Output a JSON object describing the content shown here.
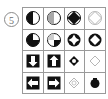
{
  "figure": {
    "kind": "matrix-reasoning-puzzle",
    "item_number": "5",
    "grid": {
      "rows": 4,
      "cols": 4
    },
    "colors": {
      "ink": "#111111",
      "grid_line": "#9a9a9a",
      "number_ink": "#6d6d6d",
      "background": "#ffffff",
      "faint_ink": "#b9b9b9"
    },
    "cells": [
      {
        "id": "r1c1",
        "row": 1,
        "col": 1,
        "shape": "circle-half-filled-left",
        "fill": "solid",
        "description": "Circle with left half filled black"
      },
      {
        "id": "r1c2",
        "row": 1,
        "col": 2,
        "shape": "circle-half-filled-left",
        "fill": "faint",
        "description": "Circle with left half filled, light grey"
      },
      {
        "id": "r1c3",
        "row": 1,
        "col": 3,
        "shape": "circle-with-diamond",
        "fill": "solid",
        "description": "Circle outline containing solid black diamond"
      },
      {
        "id": "r1c4",
        "row": 1,
        "col": 4,
        "shape": "circle-with-diamond",
        "fill": "faint",
        "description": "Circle outline containing light diamond"
      },
      {
        "id": "r2c1",
        "row": 2,
        "col": 1,
        "shape": "circle-three-quarter-filled",
        "fill": "solid",
        "description": "Circle with three quarters filled black"
      },
      {
        "id": "r2c2",
        "row": 2,
        "col": 2,
        "shape": "circle-three-quarter-filled",
        "fill": "faint",
        "description": "Circle with quarter filled, light grey"
      },
      {
        "id": "r2c3",
        "row": 2,
        "col": 3,
        "shape": "circle-with-star-cutout",
        "fill": "solid",
        "description": "Circle outline with four-point star cutout"
      },
      {
        "id": "r2c4",
        "row": 2,
        "col": 4,
        "shape": "filled-circle-star-cutout",
        "fill": "solid",
        "description": "Solid black circle with white four-point star cutout"
      },
      {
        "id": "r3c1",
        "row": 3,
        "col": 1,
        "shape": "square-with-down-arrow-cutout",
        "fill": "solid",
        "description": "Solid black square with white downward arrow cutout"
      },
      {
        "id": "r3c2",
        "row": 3,
        "col": 2,
        "shape": "square-with-up-arrow-cutout",
        "fill": "solid",
        "description": "Solid black square with white upward arrow cutout"
      },
      {
        "id": "r3c3",
        "row": 3,
        "col": 3,
        "shape": "small-diamond-in-circle",
        "fill": "solid",
        "description": "Small black diamond ring shape"
      },
      {
        "id": "r3c4",
        "row": 3,
        "col": 4,
        "shape": "small-diamond-in-circle",
        "fill": "faint",
        "description": "Small light diamond outline"
      },
      {
        "id": "r4c1",
        "row": 4,
        "col": 1,
        "shape": "square-with-left-arrow-cutout",
        "fill": "solid",
        "description": "Solid black square with white leftward arrow cutout"
      },
      {
        "id": "r4c2",
        "row": 4,
        "col": 2,
        "shape": "square-with-right-arrow-cutout",
        "fill": "solid",
        "description": "Solid black square with white rightward arrow cutout"
      },
      {
        "id": "r4c3",
        "row": 4,
        "col": 3,
        "shape": "small-diamond-in-circle",
        "fill": "faint",
        "description": "Small light diamond outline"
      },
      {
        "id": "r4c4",
        "row": 4,
        "col": 4,
        "shape": "filled-circle-notched",
        "fill": "solid",
        "description": "Small solid black circle with notch"
      }
    ]
  }
}
